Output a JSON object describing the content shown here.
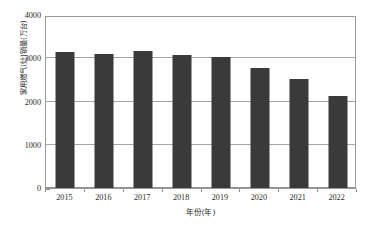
{
  "chart_data": {
    "type": "bar",
    "title": "",
    "subtitle": "",
    "xlabel": "年份(年)",
    "ylabel": "家用燃气(灶)销量(万台)",
    "categories": [
      "2015",
      "2016",
      "2017",
      "2018",
      "2019",
      "2020",
      "2021",
      "2022"
    ],
    "values": [
      3150,
      3090,
      3170,
      3080,
      3030,
      2780,
      2520,
      2120
    ],
    "series": [
      {
        "name": "家用燃气(灶)销量",
        "values": [
          3150,
          3090,
          3170,
          3080,
          3030,
          2780,
          2520,
          2120
        ]
      }
    ],
    "ylim": [
      0,
      4000
    ],
    "ytick_labels": [
      "0",
      "1000",
      "2000",
      "3000",
      "4000"
    ],
    "ytick_values": [
      0,
      1000,
      2000,
      3000,
      4000
    ],
    "grid": true,
    "grid_axis": "y",
    "legend": false,
    "legend_position": "none",
    "bar_color": "#3a3a3a",
    "frame_color": "#9a9a9a",
    "gridline_color": "#a6a6a6",
    "background_color": "#ffffff",
    "text_color": "#2b2b2b",
    "annotations": []
  }
}
